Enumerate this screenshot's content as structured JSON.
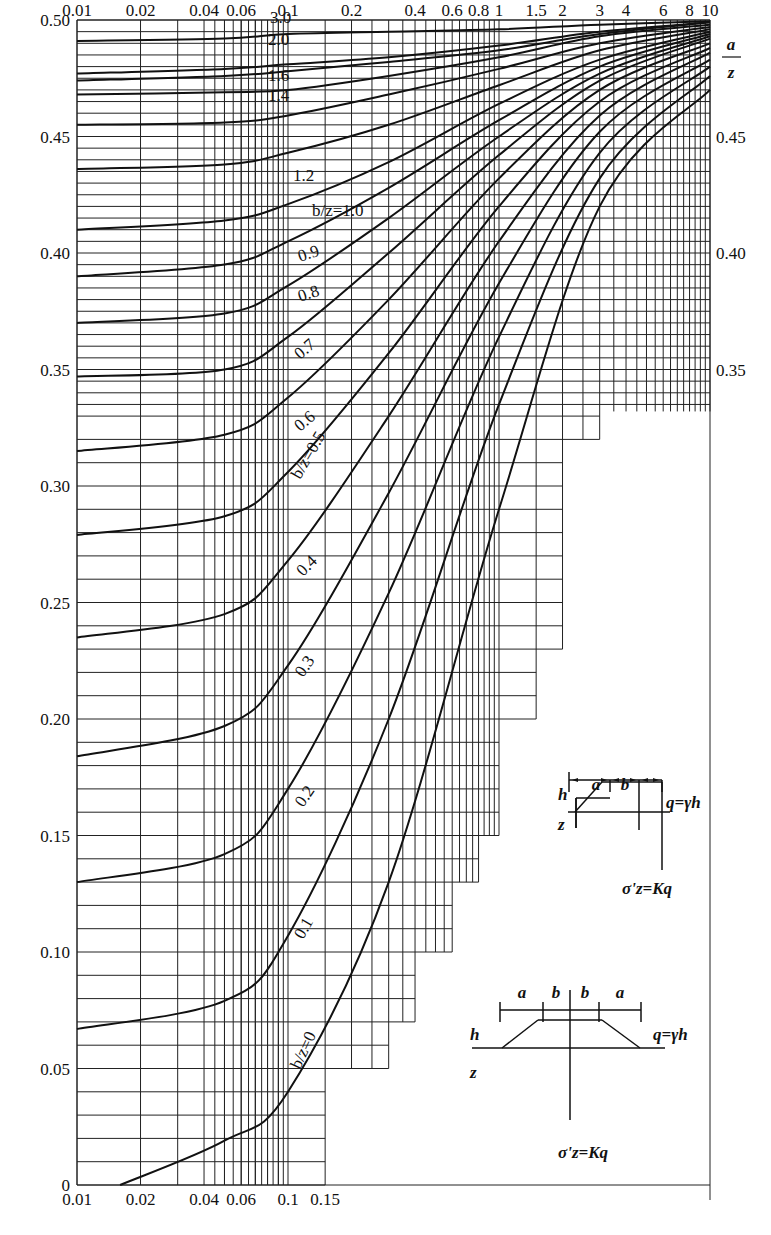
{
  "chart_data": {
    "type": "line",
    "title": "",
    "xlabel": "a/z",
    "ylabel": "K",
    "x_scale": "log",
    "xlim": [
      0.01,
      10
    ],
    "ylim": [
      0,
      0.5
    ],
    "grid": true,
    "legend_position": "inline curve labels",
    "top_x_ticks": [
      "0.01",
      "0.02",
      "0.04",
      "0.06",
      "0.1",
      "0.2",
      "0.4",
      "0.6",
      "0.8",
      "1",
      "1.5",
      "2",
      "3",
      "4",
      "6",
      "8",
      "10"
    ],
    "bottom_x_ticks": [
      "0.01",
      "0.02",
      "0.04",
      "0.06",
      "0.1",
      "0.15"
    ],
    "left_y_ticks": [
      "0",
      "0.05",
      "0.10",
      "0.15",
      "0.20",
      "0.25",
      "0.30",
      "0.35",
      "0.40",
      "0.45",
      "0.50"
    ],
    "right_y_ticks": [
      "0.35",
      "0.40",
      "0.45"
    ],
    "x_axis_label_top_right": {
      "numerator": "a",
      "denominator": "z"
    },
    "series": [
      {
        "name": "b/z=3.0",
        "label": "3.0",
        "x": [
          0.01,
          0.05,
          0.1,
          0.3,
          1,
          3,
          10
        ],
        "y": [
          0.491,
          0.492,
          0.494,
          0.495,
          0.496,
          0.498,
          0.4995
        ]
      },
      {
        "name": "b/z=2.0",
        "label": "2.0",
        "x": [
          0.01,
          0.05,
          0.1,
          0.3,
          1,
          3,
          10
        ],
        "y": [
          0.477,
          0.479,
          0.481,
          0.484,
          0.489,
          0.495,
          0.499
        ]
      },
      {
        "name": "b/z=1.8",
        "label": "",
        "x": [
          0.01,
          0.05,
          0.1,
          0.3,
          1,
          3,
          10
        ],
        "y": [
          0.474,
          0.476,
          0.478,
          0.482,
          0.487,
          0.494,
          0.499
        ]
      },
      {
        "name": "b/z=1.6",
        "label": "1.6",
        "x": [
          0.01,
          0.05,
          0.1,
          0.3,
          1,
          3,
          10
        ],
        "y": [
          0.468,
          0.469,
          0.47,
          0.476,
          0.484,
          0.493,
          0.498
        ]
      },
      {
        "name": "b/z=1.4",
        "label": "1.4",
        "x": [
          0.01,
          0.05,
          0.1,
          0.3,
          1,
          3,
          10
        ],
        "y": [
          0.455,
          0.456,
          0.459,
          0.468,
          0.479,
          0.49,
          0.497
        ]
      },
      {
        "name": "b/z=1.2",
        "label": "1.2",
        "x": [
          0.01,
          0.05,
          0.1,
          0.3,
          1,
          3,
          10
        ],
        "y": [
          0.436,
          0.438,
          0.443,
          0.455,
          0.472,
          0.487,
          0.496
        ]
      },
      {
        "name": "b/z=1.0",
        "label": "b/z=1.0",
        "x": [
          0.01,
          0.05,
          0.1,
          0.3,
          1,
          3,
          10
        ],
        "y": [
          0.41,
          0.414,
          0.421,
          0.439,
          0.464,
          0.483,
          0.495
        ]
      },
      {
        "name": "b/z=0.9",
        "label": "0.9",
        "x": [
          0.01,
          0.05,
          0.1,
          0.3,
          1,
          3,
          10
        ],
        "y": [
          0.39,
          0.395,
          0.405,
          0.428,
          0.457,
          0.48,
          0.494
        ]
      },
      {
        "name": "b/z=0.8",
        "label": "0.8",
        "x": [
          0.01,
          0.05,
          0.1,
          0.3,
          1,
          3,
          10
        ],
        "y": [
          0.37,
          0.374,
          0.386,
          0.415,
          0.45,
          0.477,
          0.493
        ]
      },
      {
        "name": "b/z=0.7",
        "label": "0.7",
        "x": [
          0.01,
          0.05,
          0.1,
          0.3,
          1,
          3,
          10
        ],
        "y": [
          0.347,
          0.35,
          0.364,
          0.4,
          0.442,
          0.474,
          0.492
        ]
      },
      {
        "name": "b/z=0.6",
        "label": "0.6",
        "x": [
          0.01,
          0.05,
          0.1,
          0.3,
          1,
          3,
          10
        ],
        "y": [
          0.315,
          0.322,
          0.338,
          0.38,
          0.432,
          0.47,
          0.49
        ]
      },
      {
        "name": "b/z=0.5",
        "label": "b/z=0.5",
        "x": [
          0.01,
          0.05,
          0.1,
          0.3,
          1,
          3,
          10
        ],
        "y": [
          0.279,
          0.287,
          0.306,
          0.357,
          0.42,
          0.465,
          0.488
        ]
      },
      {
        "name": "b/z=0.4",
        "label": "0.4",
        "x": [
          0.01,
          0.05,
          0.1,
          0.3,
          1,
          3,
          10
        ],
        "y": [
          0.235,
          0.245,
          0.268,
          0.33,
          0.405,
          0.459,
          0.486
        ]
      },
      {
        "name": "b/z=0.3",
        "label": "0.3",
        "x": [
          0.01,
          0.05,
          0.1,
          0.3,
          1,
          3,
          10
        ],
        "y": [
          0.184,
          0.197,
          0.223,
          0.297,
          0.387,
          0.452,
          0.483
        ]
      },
      {
        "name": "b/z=0.2",
        "label": "0.2",
        "x": [
          0.01,
          0.05,
          0.1,
          0.3,
          1,
          3,
          10
        ],
        "y": [
          0.13,
          0.142,
          0.17,
          0.254,
          0.364,
          0.443,
          0.48
        ]
      },
      {
        "name": "b/z=0.1",
        "label": "0.1",
        "x": [
          0.01,
          0.05,
          0.1,
          0.3,
          1,
          3,
          10
        ],
        "y": [
          0.067,
          0.079,
          0.107,
          0.2,
          0.335,
          0.432,
          0.476
        ]
      },
      {
        "name": "b/z=0",
        "label": "b/z=0",
        "x": [
          0.016,
          0.05,
          0.1,
          0.3,
          1,
          3,
          10
        ],
        "y": [
          0.0,
          0.019,
          0.04,
          0.13,
          0.29,
          0.42,
          0.47
        ]
      }
    ],
    "insets": [
      {
        "name": "half-embankment",
        "labels": [
          "a",
          "b",
          "h",
          "z",
          "q=γh",
          "σ'z=Kq"
        ]
      },
      {
        "name": "full-embankment",
        "labels": [
          "a",
          "b",
          "b",
          "a",
          "h",
          "z",
          "q=γh",
          "σ'z=Kq"
        ]
      }
    ]
  },
  "colors": {
    "line": "#111111",
    "grid": "#222222",
    "background": "#ffffff"
  }
}
